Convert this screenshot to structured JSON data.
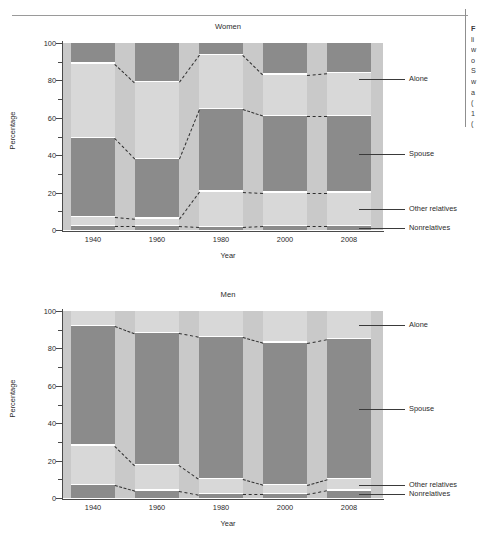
{
  "page": {
    "side_note_lines": [
      "F",
      "li",
      "w",
      "o",
      "S",
      "w",
      "a",
      "(",
      "1",
      "("
    ]
  },
  "chart_data": [
    {
      "id": "women",
      "type": "bar",
      "subtype": "stacked-100",
      "title": "Women",
      "xlabel": "Year",
      "ylabel": "Percentage",
      "ylim": [
        0,
        100
      ],
      "yticks": [
        0,
        20,
        40,
        60,
        80,
        100
      ],
      "ytick_labels": [
        "0",
        "20",
        "40",
        "60",
        "80",
        "100"
      ],
      "grid": false,
      "legend_position": "right-callouts",
      "categories": [
        "1940",
        "1960",
        "1980",
        "2000",
        "2008"
      ],
      "series": [
        {
          "name": "Nonrelatives",
          "values": [
            2,
            2,
            1.5,
            2,
            2
          ]
        },
        {
          "name": "Other relatives",
          "values": [
            5,
            4,
            19,
            18,
            18
          ]
        },
        {
          "name": "Spouse",
          "values": [
            42,
            32,
            44,
            41,
            41
          ]
        },
        {
          "name": "Alone",
          "values": [
            40,
            41,
            29,
            22,
            23
          ]
        },
        {
          "name": "Top",
          "values": [
            11,
            21,
            6.5,
            17,
            16
          ]
        }
      ],
      "boundaries": {
        "nonrelatives_top": [
          2,
          2,
          1.5,
          2,
          2
        ],
        "other_relatives_top": [
          7,
          6,
          20.5,
          20,
          20
        ],
        "spouse_top": [
          49,
          38,
          64.5,
          61,
          61
        ],
        "alone_top": [
          89,
          79,
          93.5,
          83,
          84
        ]
      },
      "annotations": [
        "Alone",
        "Spouse",
        "Other relatives",
        "Nonrelatives"
      ]
    },
    {
      "id": "men",
      "type": "bar",
      "subtype": "stacked-100",
      "title": "Men",
      "xlabel": "Year",
      "ylabel": "Percentage",
      "ylim": [
        0,
        100
      ],
      "yticks": [
        0,
        20,
        40,
        60,
        80,
        100
      ],
      "ytick_labels": [
        "0",
        "20",
        "40",
        "60",
        "80",
        "100"
      ],
      "grid": false,
      "legend_position": "right-callouts",
      "categories": [
        "1940",
        "1960",
        "1980",
        "2000",
        "2008"
      ],
      "series": [
        {
          "name": "Nonrelatives",
          "values": [
            7,
            4,
            2,
            2,
            4
          ]
        },
        {
          "name": "Other relatives",
          "values": [
            21,
            13.5,
            8,
            5,
            6
          ]
        },
        {
          "name": "Spouse",
          "values": [
            64,
            70.5,
            76,
            76,
            75
          ]
        },
        {
          "name": "Alone",
          "values": [
            8,
            12,
            14,
            17,
            15
          ]
        }
      ],
      "boundaries": {
        "nonrelatives_top": [
          7,
          4,
          2,
          2,
          4
        ],
        "other_relatives_top": [
          28,
          17.5,
          10,
          7,
          10
        ],
        "spouse_top": [
          92,
          88,
          86,
          83,
          85
        ]
      },
      "annotations": [
        "Alone",
        "Spouse",
        "Other relatives",
        "Nonrelatives"
      ]
    }
  ],
  "colors": {
    "dark_band": "#8b8b8b",
    "light_band": "#d8d8d8",
    "plot_bg": "#c9c9c9",
    "axis": "#4a4a4a",
    "separator": "#ffffff",
    "text": "#2b2b2b"
  }
}
